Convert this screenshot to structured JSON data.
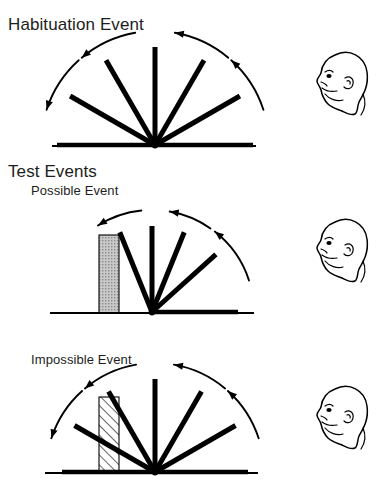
{
  "figure": {
    "title_habituation": "Habituation Event",
    "title_test_events": "Test Events",
    "label_possible_event": "Possible Event",
    "label_impossible_event": "Impossible Event",
    "background_color": "#ffffff",
    "ink_color": "#000000",
    "box_fill_color": "#b3b3b3",
    "hatch_color": "#000000"
  },
  "panels": [
    {
      "id": "habituation",
      "name": "Habituation Event",
      "pivot": {
        "x": 155,
        "y": 145
      },
      "ground_line": {
        "x1": 52,
        "x2": 256,
        "y": 146
      },
      "screen_arm_length": 98,
      "screen_angles_deg": [
        0,
        30,
        60,
        90,
        120,
        150,
        180
      ],
      "rotation_extent_deg": 180,
      "occluder_box": null,
      "occluder_outline": null,
      "observer_head": {
        "x": 341,
        "y": 78,
        "facing": "left"
      },
      "arrows": [
        {
          "from_deg": 18,
          "to_deg": 48,
          "direction": "counterclockwise"
        },
        {
          "from_deg": 50,
          "to_deg": 80,
          "direction": "counterclockwise"
        },
        {
          "from_deg": 100,
          "to_deg": 130,
          "direction": "counterclockwise"
        },
        {
          "from_deg": 132,
          "to_deg": 162,
          "direction": "counterclockwise"
        }
      ]
    },
    {
      "id": "possible",
      "name": "Possible Event",
      "pivot": {
        "x": 152,
        "y": 312
      },
      "ground_line": {
        "x1": 50,
        "x2": 254,
        "y": 313
      },
      "screen_arm_length": 86,
      "screen_angles_deg": [
        0,
        42,
        68,
        90,
        112
      ],
      "rotation_extent_deg": 112,
      "occluder_box": {
        "x": 99,
        "y": 235,
        "width": 20,
        "height": 78,
        "fill": "#b3b3b3"
      },
      "occluder_outline": null,
      "observer_head": {
        "x": 341,
        "y": 245,
        "facing": "left"
      },
      "arrows": [
        {
          "from_deg": 18,
          "to_deg": 52,
          "direction": "counterclockwise"
        },
        {
          "from_deg": 55,
          "to_deg": 80,
          "direction": "counterclockwise"
        },
        {
          "from_deg": 96,
          "to_deg": 122,
          "direction": "counterclockwise"
        }
      ]
    },
    {
      "id": "impossible",
      "name": "Impossible Event",
      "pivot": {
        "x": 155,
        "y": 472
      },
      "ground_line": {
        "x1": 45,
        "x2": 258,
        "y": 473
      },
      "screen_arm_length": 93,
      "screen_angles_deg": [
        0,
        30,
        60,
        90,
        120,
        150,
        180
      ],
      "rotation_extent_deg": 180,
      "occluder_box": null,
      "occluder_outline": {
        "x": 99,
        "y": 397,
        "width": 20,
        "height": 76,
        "style": "diagonal-hatch"
      },
      "observer_head": {
        "x": 341,
        "y": 412,
        "facing": "left"
      },
      "arrows": [
        {
          "from_deg": 18,
          "to_deg": 48,
          "direction": "counterclockwise"
        },
        {
          "from_deg": 50,
          "to_deg": 80,
          "direction": "counterclockwise"
        },
        {
          "from_deg": 100,
          "to_deg": 130,
          "direction": "counterclockwise"
        },
        {
          "from_deg": 132,
          "to_deg": 162,
          "direction": "counterclockwise"
        }
      ]
    }
  ]
}
